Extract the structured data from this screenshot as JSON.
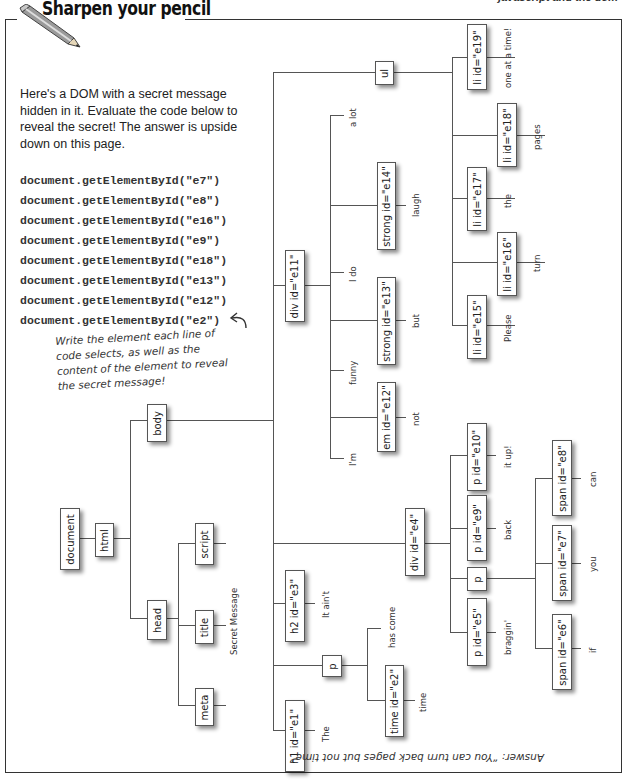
{
  "header": {
    "title": "Sharpen your pencil",
    "chapter": "javascript and the dom",
    "icon": "pencil-icon"
  },
  "intro": "Here's a DOM with a secret message hidden in it. Evaluate the code below to reveal the secret! The answer is upside down on this page.",
  "code_lines": [
    "document.getElementById(\"e7\")",
    "document.getElementById(\"e8\")",
    "document.getElementById(\"e16\")",
    "document.getElementById(\"e9\")",
    "document.getElementById(\"e18\")",
    "document.getElementById(\"e13\")",
    "document.getElementById(\"e12\")",
    "document.getElementById(\"e2\")"
  ],
  "note": "Write the element each line of code selects, as well as the content of the element to reveal the secret message!",
  "tree": {
    "document": "document",
    "html": "html",
    "head": "head",
    "body": "body",
    "script": "script",
    "title": "title",
    "title_text": "Secret Message",
    "meta": "meta",
    "ul": "ul",
    "li_e19": "li id=\"e19\"",
    "li_e19_text": "one at a time!",
    "li_e18": "li id=\"e18\"",
    "li_e18_text": "pages",
    "li_e17": "li id=\"e17\"",
    "li_e17_text": "the",
    "li_e16": "li id=\"e16\"",
    "li_e16_text": "turn",
    "li_e15": "li id=\"e15\"",
    "li_e15_text": "Please",
    "div_e11": "div id=\"e11\"",
    "e11_text_a_lot": "a lot",
    "strong_e14": "strong id=\"e14\"",
    "strong_e14_text": "laugh",
    "e11_text_i_do": "I do",
    "strong_e13": "strong id=\"e13\"",
    "strong_e13_text": "but",
    "e11_text_funny": "funny",
    "em_e12": "em id=\"e12\"",
    "em_e12_text": "not",
    "e11_text_im": "I'm",
    "div_e4": "div id=\"e4\"",
    "p_e10": "p id=\"e10\"",
    "p_e10_text": "it up!",
    "p_e9": "p id=\"e9\"",
    "p_e9_text": "back",
    "p_plain": "p",
    "span_e8": "span id=\"e8\"",
    "span_e8_text": "can",
    "span_e7": "span id=\"e7\"",
    "span_e7_text": "you",
    "span_e6": "span id=\"e6\"",
    "span_e6_text": "if",
    "p_e5": "p id=\"e5\"",
    "p_e5_text": "braggin'",
    "h2_e3": "h2 id=\"e3\"",
    "h2_e3_text": "It ain't",
    "p_body": "p",
    "p_body_text": "has come",
    "time_e2": "time id=\"e2\"",
    "time_e2_text": "time",
    "h1_e1": "h1 id=\"e1\"",
    "h1_e1_text": "The"
  },
  "answer": "Answer: “You can turn back pages but not time”"
}
